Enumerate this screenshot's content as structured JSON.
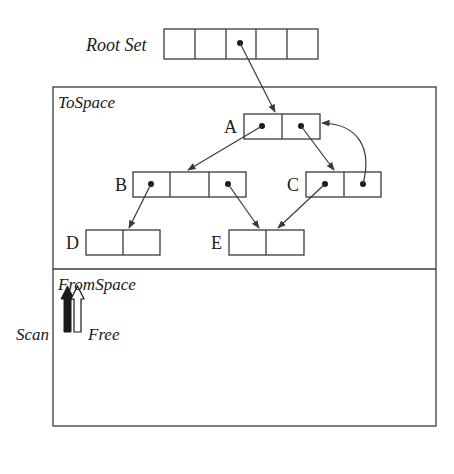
{
  "colors": {
    "stroke": "#3a3a3a",
    "text": "#1a1a1a",
    "background": "#ffffff"
  },
  "labels": {
    "root_set": "Root Set",
    "to_space": "ToSpace",
    "from_space": "FromSpace",
    "scan": "Scan",
    "free": "Free"
  },
  "nodes": [
    {
      "id": "A",
      "label": "A",
      "cells": 2,
      "pointers": [
        0,
        1
      ]
    },
    {
      "id": "B",
      "label": "B",
      "cells": 3,
      "pointers": [
        0,
        2
      ]
    },
    {
      "id": "C",
      "label": "C",
      "cells": 2,
      "pointers": [
        0,
        1
      ]
    },
    {
      "id": "D",
      "label": "D",
      "cells": 2,
      "pointers": []
    },
    {
      "id": "E",
      "label": "E",
      "cells": 2,
      "pointers": []
    }
  ],
  "root_set": {
    "cells": 5,
    "pointer_cell": 2
  },
  "edges": [
    {
      "from": "RootSet[2]",
      "to": "A"
    },
    {
      "from": "A[0]",
      "to": "B"
    },
    {
      "from": "A[1]",
      "to": "C"
    },
    {
      "from": "B[0]",
      "to": "D"
    },
    {
      "from": "B[2]",
      "to": "E"
    },
    {
      "from": "C[0]",
      "to": "E"
    },
    {
      "from": "C[1]",
      "to": "A"
    }
  ]
}
